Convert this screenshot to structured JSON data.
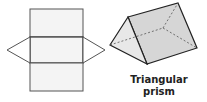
{
  "figure": {
    "net_label": "",
    "solid_label_line1": "Triangular",
    "solid_label_line2": "prism"
  },
  "colors": {
    "net_fill": "#f4f4f4",
    "net_stroke": "#555555",
    "prism_face_light": "#e6e6e6",
    "prism_face_dark": "#cfcfcf",
    "prism_stroke": "#222222"
  }
}
